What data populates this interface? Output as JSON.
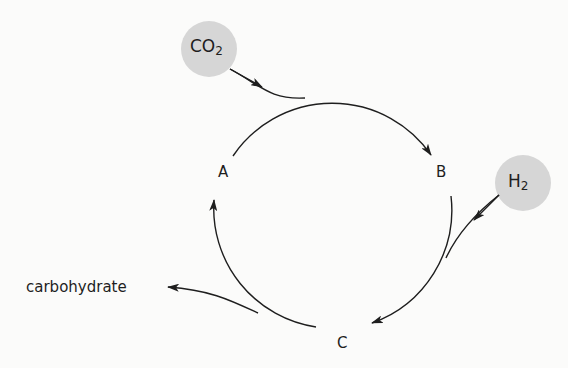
{
  "diagram": {
    "type": "cycle",
    "nodes": [
      {
        "id": "A",
        "label": "A"
      },
      {
        "id": "B",
        "label": "B"
      },
      {
        "id": "C",
        "label": "C"
      }
    ],
    "inputs": [
      {
        "id": "co2",
        "base": "CO",
        "subscript": "2",
        "enters_between": [
          "A",
          "B"
        ]
      },
      {
        "id": "h2",
        "base": "H",
        "subscript": "2",
        "enters_between": [
          "B",
          "C"
        ]
      }
    ],
    "outputs": [
      {
        "id": "carbohydrate",
        "label": "carbohydrate",
        "leaves_between": [
          "C",
          "A"
        ]
      }
    ],
    "edges": [
      {
        "from": "A",
        "to": "B"
      },
      {
        "from": "B",
        "to": "C"
      },
      {
        "from": "C",
        "to": "A"
      }
    ],
    "colors": {
      "line": "#1e1e1e",
      "molecule_fill": "#d6d6d6",
      "background": "#fbfbfa"
    }
  }
}
